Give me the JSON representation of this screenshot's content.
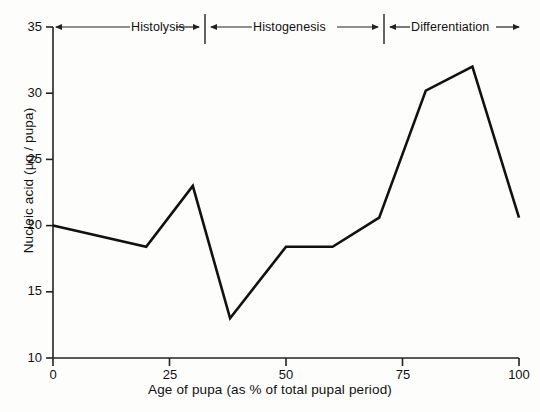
{
  "chart_data": {
    "type": "line",
    "title": "",
    "xlabel": "Age of pupa (as % of total pupal period)",
    "ylabel": "Nucleic acid (µg / pupa)",
    "xlim": [
      0,
      100
    ],
    "ylim": [
      10,
      35
    ],
    "grid": false,
    "legend": "none",
    "xticks": [
      0,
      25,
      50,
      75,
      100
    ],
    "xtick_labels": [
      "0",
      "25",
      "50",
      "75",
      "100"
    ],
    "yticks": [
      10,
      15,
      20,
      25,
      30,
      35
    ],
    "ytick_labels": [
      "10",
      "15",
      "20",
      "25",
      "30",
      "35"
    ],
    "series": [
      {
        "name": "Nucleic acid",
        "x": [
          0,
          20,
          30,
          38,
          50,
          60,
          70,
          80,
          90,
          100
        ],
        "values": [
          20.0,
          18.4,
          23.0,
          13.0,
          18.4,
          18.4,
          20.6,
          30.2,
          32.0,
          20.6
        ],
        "color": "#111111"
      }
    ],
    "annotations": [
      {
        "label": "Histolysis",
        "x_start": 0,
        "x_end": 33
      },
      {
        "label": "Histogenesis",
        "x_start": 33,
        "x_end": 70
      },
      {
        "label": "Differentiation",
        "x_start": 70,
        "x_end": 100
      }
    ],
    "phase_dividers": [
      33,
      70
    ]
  },
  "axes": {
    "x_title": "Age of pupa (as % of total pupal period)",
    "y_title": "Nucleic acid (µg / pupa)",
    "x_tick_labels": [
      "0",
      "25",
      "50",
      "75",
      "100"
    ],
    "y_tick_labels": [
      "10",
      "15",
      "20",
      "25",
      "30",
      "35"
    ]
  },
  "phases": [
    {
      "label": "Histolysis"
    },
    {
      "label": "Histogenesis"
    },
    {
      "label": "Differentiation"
    }
  ],
  "colors": {
    "line": "#111111",
    "axis": "#222222",
    "background": "#fdfdfc",
    "text": "#111111"
  }
}
